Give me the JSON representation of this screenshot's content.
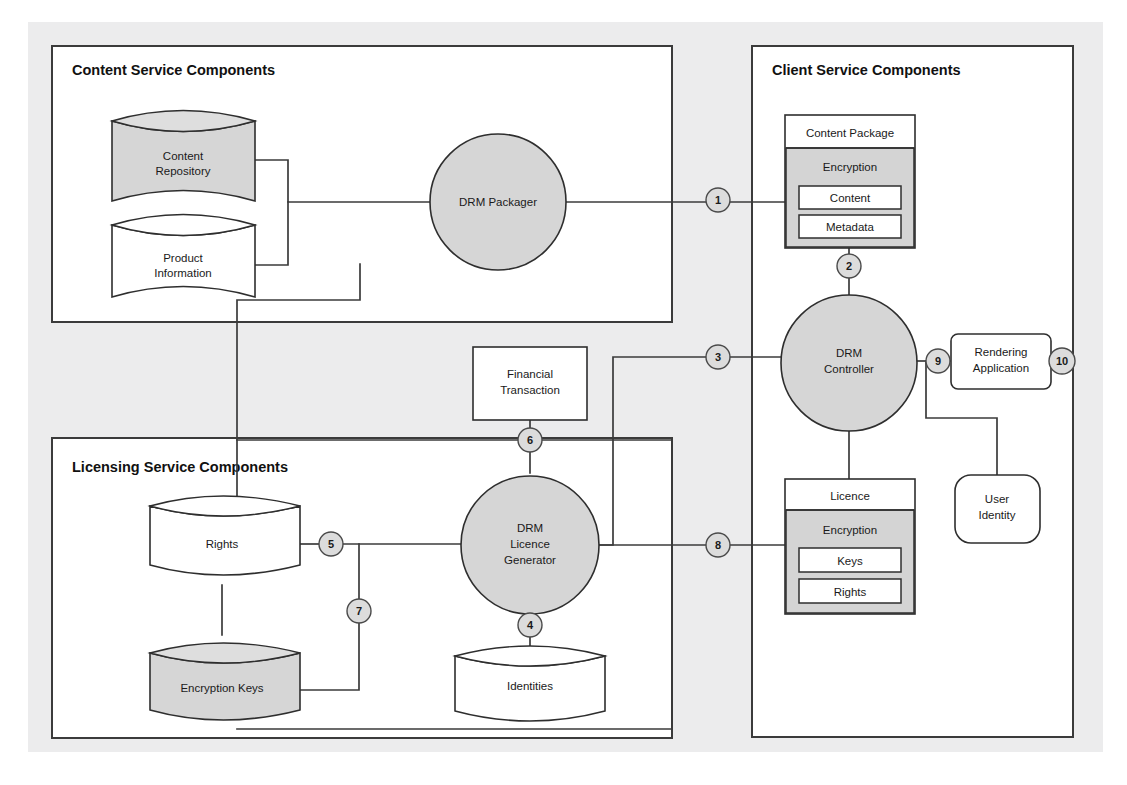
{
  "diagram": {
    "background_color": "#ececed",
    "panel_fill": "#ffffff",
    "shaded_fill": "#d6d6d6",
    "line_color": "#3b3b3b"
  },
  "panels": [
    {
      "id": "content-service",
      "title": "Content Service Components"
    },
    {
      "id": "client-service",
      "title": "Client Service Components"
    },
    {
      "id": "licensing-service",
      "title": "Licensing Service Components"
    }
  ],
  "nodes": {
    "content_repository": {
      "label_line1": "Content",
      "label_line2": "Repository",
      "shape": "cylinder",
      "fill": "shaded"
    },
    "product_information": {
      "label_line1": "Product",
      "label_line2": "Information",
      "shape": "cylinder",
      "fill": "white"
    },
    "drm_packager": {
      "label": "DRM Packager",
      "shape": "circle",
      "fill": "shaded"
    },
    "content_package": {
      "header": "Content Package",
      "encryption": "Encryption",
      "items": [
        "Content",
        "Metadata"
      ],
      "shape": "box"
    },
    "drm_controller": {
      "label_line1": "DRM",
      "label_line2": "Controller",
      "shape": "circle",
      "fill": "shaded"
    },
    "rendering_application": {
      "label_line1": "Rendering",
      "label_line2": "Application",
      "shape": "rounded-box",
      "fill": "white"
    },
    "user_identity": {
      "label_line1": "User",
      "label_line2": "Identity",
      "shape": "rounded-box",
      "fill": "white"
    },
    "licence": {
      "header": "Licence",
      "encryption": "Encryption",
      "items": [
        "Keys",
        "Rights"
      ],
      "shape": "box"
    },
    "financial_transaction": {
      "label_line1": "Financial",
      "label_line2": "Transaction",
      "shape": "box",
      "fill": "white"
    },
    "drm_licence_generator": {
      "label_line1": "DRM",
      "label_line2": "Licence",
      "label_line3": "Generator",
      "shape": "circle",
      "fill": "shaded"
    },
    "identities": {
      "label": "Identities",
      "shape": "cylinder",
      "fill": "white"
    },
    "rights_store": {
      "label": "Rights",
      "shape": "cylinder",
      "fill": "white"
    },
    "encryption_keys": {
      "label": "Encryption Keys",
      "shape": "cylinder",
      "fill": "shaded"
    }
  },
  "flow_badges": [
    {
      "id": "badge-1",
      "number": "1",
      "x": 718,
      "y": 200
    },
    {
      "id": "badge-2",
      "number": "2",
      "x": 849,
      "y": 266
    },
    {
      "id": "badge-3",
      "number": "3",
      "x": 718,
      "y": 357
    },
    {
      "id": "badge-4",
      "number": "4",
      "x": 530,
      "y": 625
    },
    {
      "id": "badge-5",
      "number": "5",
      "x": 331,
      "y": 544
    },
    {
      "id": "badge-6",
      "number": "6",
      "x": 530,
      "y": 440
    },
    {
      "id": "badge-7",
      "number": "7",
      "x": 359,
      "y": 611
    },
    {
      "id": "badge-8",
      "number": "8",
      "x": 718,
      "y": 545
    },
    {
      "id": "badge-9",
      "number": "9",
      "x": 938,
      "y": 361
    },
    {
      "id": "badge-10",
      "number": "10",
      "x": 1062,
      "y": 361
    }
  ]
}
